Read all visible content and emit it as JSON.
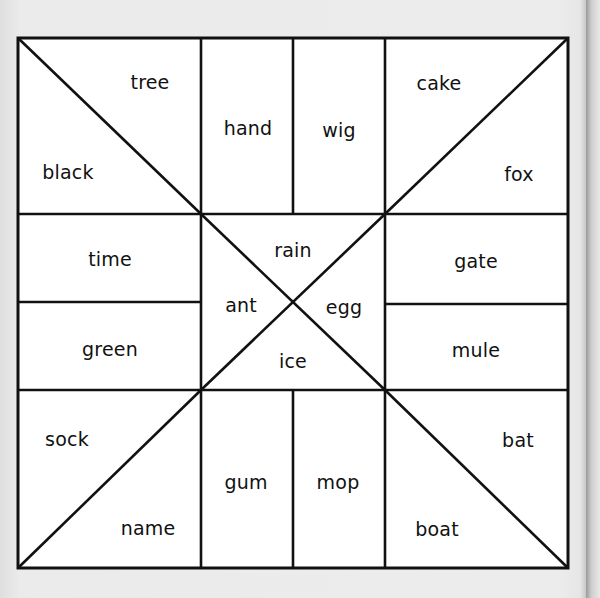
{
  "worksheet": {
    "type": "word-puzzle-grid",
    "line_color": "#111111",
    "cell_color": "#ffffff",
    "paper_color": "#e6e6e6",
    "regions": {
      "top_left": {
        "upper_triangle": "tree",
        "lower_triangle": "black"
      },
      "top_middle": {
        "left_column": "hand",
        "right_column": "wig"
      },
      "top_right": {
        "upper_triangle": "cake",
        "lower_triangle": "fox"
      },
      "middle_left": {
        "upper_row": "time",
        "lower_row": "green"
      },
      "center": {
        "top_triangle": "rain",
        "left_triangle": "ant",
        "right_triangle": "egg",
        "bottom_triangle": "ice"
      },
      "middle_right": {
        "upper_row": "gate",
        "lower_row": "mule"
      },
      "bottom_left": {
        "upper_triangle": "sock",
        "lower_triangle": "name"
      },
      "bottom_middle": {
        "left_column": "gum",
        "right_column": "mop"
      },
      "bottom_right": {
        "upper_triangle": "bat",
        "lower_triangle": "boat"
      }
    }
  }
}
